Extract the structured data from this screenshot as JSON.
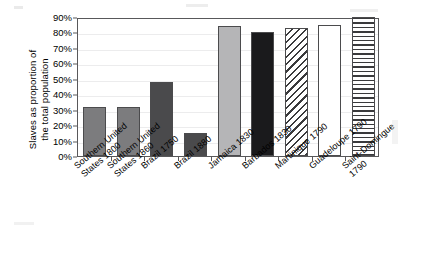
{
  "chart_data": {
    "type": "bar",
    "title": "",
    "xlabel": "",
    "ylabel": "Slaves as proportion of\nthe total population",
    "ylim": [
      0,
      90
    ],
    "ytick_labels": [
      "90%",
      "80%",
      "70%",
      "60%",
      "50%",
      "40%",
      "30%",
      "20%",
      "10%",
      "0%"
    ],
    "ytick_values": [
      90,
      80,
      70,
      60,
      50,
      40,
      30,
      20,
      10,
      0
    ],
    "grid": true,
    "legend": "none",
    "categories": [
      "Southern United\nStates 1800",
      "Southern United\nStates 1860",
      "Brazil 1750",
      "Brazil 1880",
      "Jamaica 1830",
      "Barbados 1830",
      "Martinique 1790",
      "Guadeloupe 1790",
      "Saint-Domingue 1790"
    ],
    "values": [
      32,
      32,
      48,
      15,
      84,
      80,
      83,
      85,
      90
    ],
    "bar_fills": [
      "medium-gray",
      "medium-gray",
      "dark-gray",
      "dark-gray",
      "light-gray",
      "black",
      "diagonal-hatch",
      "white",
      "horizontal-lines"
    ],
    "bar_colors": [
      "#7c7c7e",
      "#7c7c7e",
      "#4a4a4c",
      "#4a4a4c",
      "#b5b5b7",
      "#1a1a1c",
      "#ffffff",
      "#ffffff",
      "#ffffff"
    ]
  }
}
